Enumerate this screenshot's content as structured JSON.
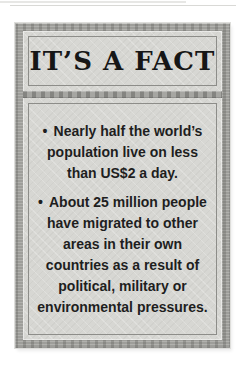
{
  "factbox": {
    "title": "IT’S A FACT",
    "items": [
      {
        "bullet": "•",
        "lines": [
          "Nearly half the world’s",
          "population live on less",
          "than US$2 a day."
        ]
      },
      {
        "bullet": "•",
        "lines": [
          "About 25 million people",
          "have migrated to other",
          "areas in their own",
          "countries as a result of",
          "political, military or",
          "environmental pressures."
        ]
      }
    ],
    "colors": {
      "page_background": "#ffffff",
      "frame": "#a6a6a2",
      "panel_background": "#d7d7d3",
      "panel_outline": "#8d8d89",
      "title_text": "#161616",
      "body_text": "#1e1e1e"
    }
  }
}
